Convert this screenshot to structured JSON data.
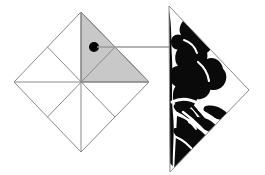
{
  "figure": {
    "title": "Folded-paper cut-out diagram",
    "background_color": "#ffffff",
    "width": 265,
    "height": 175,
    "line_color": "#8a8a8a",
    "line_width": 1,
    "highlight_fill": "#c8c8c8",
    "highlight_stroke": "#6e6e6e",
    "marker_color": "#000000",
    "pattern_color": "#0a0a0a",
    "connector_color": "#9a9a9a"
  },
  "left_shape": {
    "name": "folded-square-diamond",
    "description": "Square rotated 45 degrees, divided by two diagonals and two medians into eight triangles",
    "vertices": {
      "top": [
        81,
        12
      ],
      "right": [
        149,
        82
      ],
      "bottom": [
        81,
        152
      ],
      "left": [
        14,
        82
      ]
    },
    "center": [
      81,
      82
    ],
    "fold_lines": [
      {
        "name": "vertical-fold",
        "from": [
          81,
          12
        ],
        "to": [
          81,
          152
        ]
      },
      {
        "name": "horizontal-fold",
        "from": [
          14,
          82
        ],
        "to": [
          149,
          82
        ]
      },
      {
        "name": "median-upper-left",
        "from": [
          47,
          47
        ],
        "to": [
          115,
          117
        ]
      },
      {
        "name": "median-upper-right",
        "from": [
          115,
          47
        ],
        "to": [
          47,
          117
        ]
      }
    ],
    "highlighted_segment": {
      "name": "selected-quadrant",
      "points": [
        [
          81,
          12
        ],
        [
          149,
          82
        ],
        [
          81,
          82
        ]
      ],
      "fill": "#c8c8c8"
    },
    "marker_dot": {
      "name": "reference-dot",
      "center": [
        94,
        47
      ],
      "radius": 5,
      "color": "#000000"
    }
  },
  "connector": {
    "name": "callout-line",
    "from": [
      99,
      47
    ],
    "to": [
      170,
      47
    ],
    "color": "#9a9a9a"
  },
  "right_shape": {
    "name": "cut-pattern-triangle",
    "description": "Right-pointing triangle filled with a black floral and leaf silhouette cut pattern",
    "vertices": {
      "top_left": [
        169,
        6
      ],
      "right": [
        249,
        90
      ],
      "bottom_left": [
        170,
        172
      ]
    },
    "outline_color": "#8a8a8a",
    "pattern_color": "#0a0a0a",
    "pattern_motifs": [
      "flower-petals",
      "leaf-vine",
      "stem"
    ]
  }
}
